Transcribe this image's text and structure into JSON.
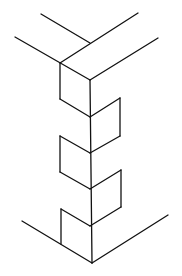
{
  "diagram": {
    "type": "isometric line drawing",
    "stroke_color": "#111111",
    "background_color": "#ffffff",
    "segments": [
      {
        "id": "top-back-left-edge",
        "x1": 41,
        "y1": 14,
        "x2": 90,
        "y2": 43
      },
      {
        "id": "top-back-right-edge",
        "x1": 138,
        "y1": 13,
        "x2": 60,
        "y2": 63
      },
      {
        "id": "top-front-left-edge",
        "x1": 15,
        "y1": 37,
        "x2": 90,
        "y2": 80
      },
      {
        "id": "top-front-right-edge",
        "x1": 158,
        "y1": 38,
        "x2": 90,
        "y2": 80
      },
      {
        "id": "center-vertical-edge",
        "x1": 90,
        "y1": 80,
        "x2": 92,
        "y2": 263
      },
      {
        "id": "notch1-left-vertical",
        "x1": 60,
        "y1": 63,
        "x2": 60,
        "y2": 99
      },
      {
        "id": "notch1-left-diagonal",
        "x1": 60,
        "y1": 99,
        "x2": 90,
        "y2": 117
      },
      {
        "id": "notch1-right-diagonal",
        "x1": 90,
        "y1": 117,
        "x2": 120,
        "y2": 98
      },
      {
        "id": "notch1-right-vertical",
        "x1": 120,
        "y1": 98,
        "x2": 120,
        "y2": 136
      },
      {
        "id": "notch1-right-bottom",
        "x1": 120,
        "y1": 136,
        "x2": 90,
        "y2": 153
      },
      {
        "id": "notch2-left-top",
        "x1": 60,
        "y1": 136,
        "x2": 90,
        "y2": 153
      },
      {
        "id": "notch2-left-vertical",
        "x1": 60,
        "y1": 136,
        "x2": 60,
        "y2": 172
      },
      {
        "id": "notch2-left-diagonal",
        "x1": 60,
        "y1": 172,
        "x2": 90,
        "y2": 189
      },
      {
        "id": "notch2-right-diagonal",
        "x1": 90,
        "y1": 189,
        "x2": 121,
        "y2": 170
      },
      {
        "id": "notch2-right-vertical",
        "x1": 121,
        "y1": 170,
        "x2": 121,
        "y2": 207
      },
      {
        "id": "notch2-right-bottom",
        "x1": 121,
        "y1": 207,
        "x2": 90,
        "y2": 226
      },
      {
        "id": "notch3-left-top",
        "x1": 61,
        "y1": 209,
        "x2": 90,
        "y2": 226
      },
      {
        "id": "notch3-left-vertical",
        "x1": 61,
        "y1": 209,
        "x2": 61,
        "y2": 244
      },
      {
        "id": "base-left-edge",
        "x1": 22,
        "y1": 221,
        "x2": 92,
        "y2": 263
      },
      {
        "id": "base-right-edge",
        "x1": 92,
        "y1": 263,
        "x2": 168,
        "y2": 215
      }
    ]
  }
}
